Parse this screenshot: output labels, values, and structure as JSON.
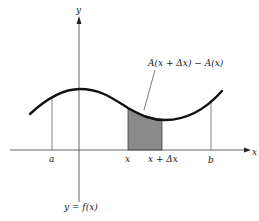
{
  "diagram": {
    "axes": {
      "x_label": "x",
      "y_label": "y"
    },
    "curve_label": "y = f(x)",
    "area_label": "A(x + Δx) − A(x)",
    "ticks": {
      "a": "a",
      "x": "x",
      "x_plus_dx": "x + Δx",
      "b": "b"
    },
    "colors": {
      "curve": "#111111",
      "shading": "#8a8a8a",
      "axes": "#555555"
    }
  }
}
